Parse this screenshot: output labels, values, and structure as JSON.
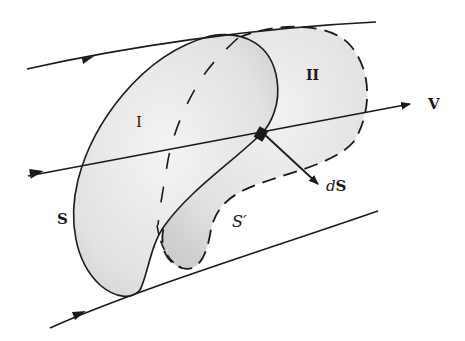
{
  "diagram": {
    "labels": {
      "region_1": "I",
      "region_2": "II",
      "velocity": "V",
      "surface_s": "S",
      "surface_s_prime": "S′",
      "area_element": "dS"
    },
    "colors": {
      "background": "#ffffff",
      "line": "#1a1a1a",
      "fill_light": "#efefef",
      "fill_dark": "#cfcfcf"
    }
  }
}
